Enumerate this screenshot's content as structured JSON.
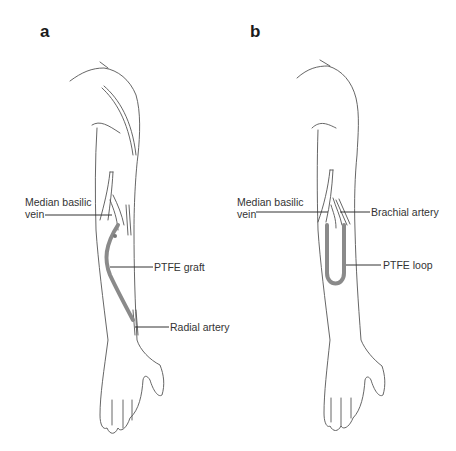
{
  "panels": [
    {
      "letter": "a",
      "labels": {
        "vein_line1": "Median basilic",
        "vein_line2": "vein",
        "graft": "PTFE graft",
        "artery": "Radial artery"
      }
    },
    {
      "letter": "b",
      "labels": {
        "vein_line1": "Median basilic",
        "vein_line2": "vein",
        "artery": "Brachial artery",
        "graft": "PTFE loop"
      }
    }
  ],
  "colors": {
    "outline": "#555555",
    "graft": "#8a8a8a",
    "leader": "#333333",
    "text": "#333333"
  }
}
